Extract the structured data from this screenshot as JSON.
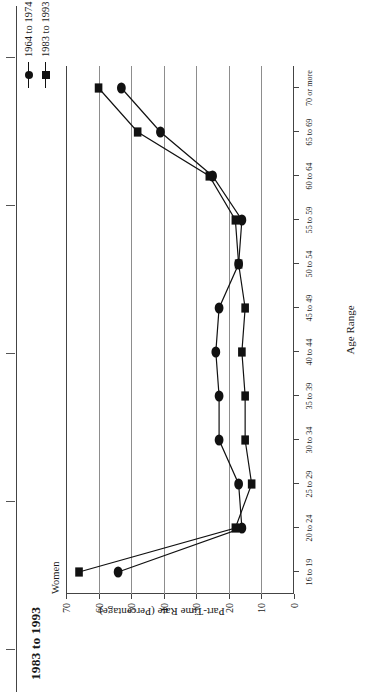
{
  "figure": {
    "title": "1983 to 1993",
    "panel_label": "Women"
  },
  "legend": {
    "position": "top-right",
    "entries": [
      {
        "label": "1964 to 1974",
        "marker": "circle-marker",
        "color": "#111111"
      },
      {
        "label": "1983 to 1993",
        "marker": "square-marker",
        "color": "#111111"
      }
    ]
  },
  "axes": {
    "x_title": "Age Range",
    "y_title": "Part-Time Rate (Percentage)",
    "y_ticks": [
      "0",
      "10",
      "20",
      "30",
      "40",
      "50",
      "60",
      "70"
    ],
    "x_ticks": [
      "16 to 19",
      "20 to 24",
      "25 to 29",
      "30 to 34",
      "35 to 39",
      "40 to 44",
      "45 to 49",
      "50 to 54",
      "55 to 59",
      "60 to 64",
      "65 to 69",
      "70 or more"
    ]
  },
  "chart_data": {
    "type": "line",
    "title": "1983 to 1993",
    "subtitle": "Women",
    "xlabel": "Age Range",
    "ylabel": "Part-Time Rate (Percentage)",
    "ylim": [
      0,
      70
    ],
    "ytick_step": 10,
    "grid": "horizontal-gridlines-at-y-ticks",
    "legend_position": "top-right",
    "categories": [
      "16 to 19",
      "20 to 24",
      "25 to 29",
      "30 to 34",
      "35 to 39",
      "40 to 44",
      "45 to 49",
      "50 to 54",
      "55 to 59",
      "60 to 64",
      "65 to 69",
      "70 or more"
    ],
    "series": [
      {
        "name": "1964 to 1974",
        "marker": "circle",
        "color": "#111111",
        "values": [
          54,
          16,
          17,
          23,
          23,
          24,
          23,
          17,
          16,
          25,
          41,
          53
        ]
      },
      {
        "name": "1983 to 1993",
        "marker": "square",
        "color": "#111111",
        "values": [
          66,
          18,
          13,
          15,
          15,
          16,
          15,
          17,
          18,
          26,
          48,
          60
        ]
      }
    ]
  }
}
